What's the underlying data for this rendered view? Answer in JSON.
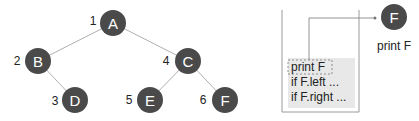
{
  "colors": {
    "node_fill": "#4a4a4a",
    "edge": "#b0b0b0",
    "frame_fill": "#e8e8e8",
    "frame_border": "#9a9a9a"
  },
  "tree": {
    "nodes": [
      {
        "id": "A",
        "label": "A",
        "order": "1",
        "cx": 113,
        "cy": 23
      },
      {
        "id": "B",
        "label": "B",
        "order": "2",
        "cx": 38,
        "cy": 61
      },
      {
        "id": "C",
        "label": "C",
        "order": "4",
        "cx": 188,
        "cy": 61
      },
      {
        "id": "D",
        "label": "D",
        "order": "3",
        "cx": 75,
        "cy": 100
      },
      {
        "id": "E",
        "label": "E",
        "order": "5",
        "cx": 150,
        "cy": 100
      },
      {
        "id": "F",
        "label": "F",
        "order": "6",
        "cx": 225,
        "cy": 100
      }
    ],
    "edges": [
      [
        "A",
        "B"
      ],
      [
        "A",
        "C"
      ],
      [
        "B",
        "D"
      ],
      [
        "C",
        "E"
      ],
      [
        "C",
        "F"
      ]
    ]
  },
  "stack": {
    "frame_lines": [
      "print F",
      "if F.left ...",
      "if F.right ..."
    ],
    "highlighted_line": "print F"
  },
  "output": {
    "node_label": "F",
    "caption": "print F"
  }
}
